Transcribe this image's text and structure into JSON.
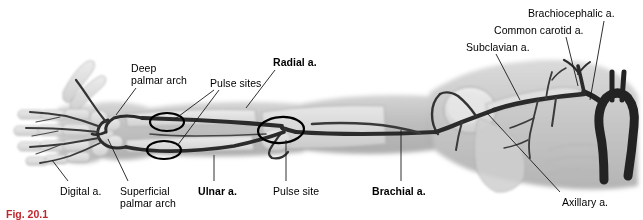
{
  "figure": {
    "caption": "Fig. 20.1",
    "title_alt": "Arterial supply of the upper limb (angiogram)",
    "colors": {
      "label_text": "#000000",
      "caption_text": "#c0272d",
      "leader_line": "#1a1a1a",
      "pulse_circle": "#000000",
      "vessel_dark": "#2b2b2b",
      "vessel_mid": "#5a5a5a",
      "soft_tissue": "#c9c9c9",
      "bone_light": "#e2e2e2",
      "background": "#ffffff"
    }
  },
  "labels": [
    {
      "id": "deep-palmar-arch",
      "text": "Deep\npalmar arch",
      "bold": false,
      "x": 131,
      "y": 63,
      "align": "left"
    },
    {
      "id": "pulse-sites",
      "text": "Pulse sites",
      "bold": false,
      "x": 210,
      "y": 78,
      "align": "left"
    },
    {
      "id": "radial-a",
      "text": "Radial a.",
      "bold": true,
      "x": 273,
      "y": 57,
      "align": "left"
    },
    {
      "id": "subclavian-a",
      "text": "Subclavian a.",
      "bold": false,
      "x": 466,
      "y": 42,
      "align": "left"
    },
    {
      "id": "common-carotid-a",
      "text": "Common carotid a.",
      "bold": false,
      "x": 494,
      "y": 25,
      "align": "left"
    },
    {
      "id": "brachiocephalic-a",
      "text": "Brachiocephalic a.",
      "bold": false,
      "x": 528,
      "y": 8,
      "align": "left"
    },
    {
      "id": "digital-a",
      "text": "Digital a.",
      "bold": false,
      "x": 60,
      "y": 186,
      "align": "left"
    },
    {
      "id": "superficial-palmar-arch",
      "text": "Superficial\npalmar arch",
      "bold": false,
      "x": 120,
      "y": 186,
      "align": "left"
    },
    {
      "id": "ulnar-a",
      "text": "Ulnar a.",
      "bold": true,
      "x": 198,
      "y": 186,
      "align": "left"
    },
    {
      "id": "pulse-site",
      "text": "Pulse site",
      "bold": false,
      "x": 273,
      "y": 186,
      "align": "left"
    },
    {
      "id": "brachial-a",
      "text": "Brachial a.",
      "bold": true,
      "x": 372,
      "y": 186,
      "align": "left"
    },
    {
      "id": "axillary-a",
      "text": "Axillary a.",
      "bold": false,
      "x": 562,
      "y": 197,
      "align": "left"
    }
  ],
  "leader_lines": [
    {
      "id": "leader-deep-palmar-arch",
      "x1": 136,
      "y1": 88,
      "x2": 116,
      "y2": 115
    },
    {
      "id": "leader-pulse-sites-upper",
      "x1": 214,
      "y1": 90,
      "x2": 175,
      "y2": 119
    },
    {
      "id": "leader-pulse-sites-lower",
      "x1": 219,
      "y1": 90,
      "x2": 177,
      "y2": 146
    },
    {
      "id": "leader-radial-a",
      "x1": 275,
      "y1": 70,
      "x2": 246,
      "y2": 108
    },
    {
      "id": "leader-subclavian-a",
      "x1": 496,
      "y1": 54,
      "x2": 520,
      "y2": 100
    },
    {
      "id": "leader-common-carotid-a",
      "x1": 566,
      "y1": 37,
      "x2": 578,
      "y2": 86
    },
    {
      "id": "leader-brachiocephalic-a",
      "x1": 604,
      "y1": 21,
      "x2": 590,
      "y2": 100
    },
    {
      "id": "leader-digital-a",
      "x1": 68,
      "y1": 181,
      "x2": 52,
      "y2": 160
    },
    {
      "id": "leader-superficial-palmar-arch",
      "x1": 128,
      "y1": 181,
      "x2": 108,
      "y2": 139
    },
    {
      "id": "leader-ulnar-a",
      "x1": 214,
      "y1": 181,
      "x2": 214,
      "y2": 155
    },
    {
      "id": "leader-pulse-site",
      "x1": 286,
      "y1": 181,
      "x2": 286,
      "y2": 140
    },
    {
      "id": "leader-brachial-a",
      "x1": 401,
      "y1": 181,
      "x2": 401,
      "y2": 130
    },
    {
      "id": "leader-axillary-a",
      "x1": 560,
      "y1": 192,
      "x2": 487,
      "y2": 113
    }
  ],
  "pulse_markers": [
    {
      "id": "pulse-marker-radial-wrist",
      "cx": 167,
      "cy": 122,
      "rx": 17,
      "ry": 9,
      "rotate": 0
    },
    {
      "id": "pulse-marker-ulnar-wrist",
      "cx": 164,
      "cy": 150,
      "rx": 17,
      "ry": 9,
      "rotate": 0
    },
    {
      "id": "pulse-marker-brachial-elbow",
      "cx": 281,
      "cy": 130,
      "rx": 23,
      "ry": 13,
      "rotate": -4
    }
  ]
}
